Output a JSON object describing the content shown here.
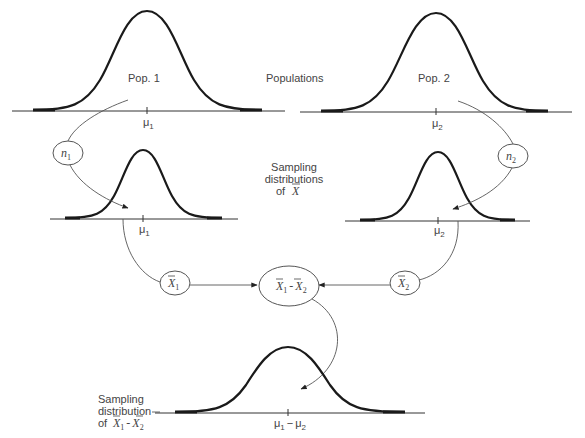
{
  "diagram": {
    "title_labels": {
      "populations": "Populations",
      "sampling_dist_line1": "Sampling",
      "sampling_dist_line2": "distributions",
      "sampling_dist_line3_prefix": "of",
      "sampling_dist_line3_symbol": "X",
      "bottom_line1": "Sampling",
      "bottom_line2": "distribution",
      "bottom_line3_prefix": "of"
    },
    "populations": [
      {
        "label": "Pop. 1",
        "mean_symbol": "μ",
        "mean_sub": "1"
      },
      {
        "label": "Pop. 2",
        "mean_symbol": "μ",
        "mean_sub": "2"
      }
    ],
    "sampling_distributions": [
      {
        "mean_symbol": "μ",
        "mean_sub": "1"
      },
      {
        "mean_symbol": "μ",
        "mean_sub": "2"
      }
    ],
    "nodes": {
      "n1": {
        "symbol": "n",
        "sub": "1"
      },
      "n2": {
        "symbol": "n",
        "sub": "2"
      },
      "xbar1": {
        "symbol": "X",
        "sub": "1"
      },
      "xbar2": {
        "symbol": "X",
        "sub": "2"
      },
      "diff": {
        "left_symbol": "X",
        "left_sub": "1",
        "operator": "-",
        "right_symbol": "X",
        "right_sub": "2"
      }
    },
    "difference_distribution": {
      "mean_left": "μ",
      "mean_left_sub": "1",
      "operator": "−",
      "mean_right": "μ",
      "mean_right_sub": "2"
    },
    "bottom_label_symbol": {
      "left": "X",
      "left_sub": "1",
      "operator": "-",
      "right": "X",
      "right_sub": "2"
    }
  }
}
